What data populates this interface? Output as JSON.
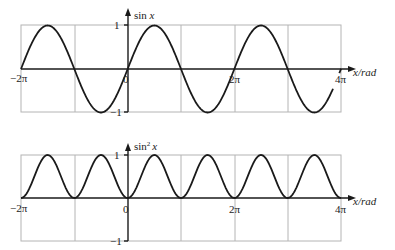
{
  "chart_data": [
    {
      "type": "line",
      "title": "",
      "ylabel": "sin x",
      "xlabel": "x/rad",
      "function": "sin(x)",
      "xlim": [
        "-2π",
        "4π"
      ],
      "ylim": [
        -1,
        1
      ],
      "x_ticks": [
        "−2π",
        "0",
        "2π",
        "4π"
      ],
      "y_ticks": [
        "1",
        "−1"
      ],
      "grid": true,
      "x": [
        -6.283,
        -4.712,
        -3.142,
        -1.571,
        0,
        1.571,
        3.142,
        4.712,
        6.283,
        7.854,
        9.425,
        10.996
      ],
      "values": [
        0,
        1,
        0,
        -1,
        0,
        1,
        0,
        -1,
        0,
        1,
        0,
        -1
      ],
      "note": "curve drawn from −2π up to about 3.85π"
    },
    {
      "type": "line",
      "title": "",
      "ylabel": "sin² x",
      "xlabel": "x/rad",
      "function": "sin^2(x)",
      "xlim": [
        "-2π",
        "4π"
      ],
      "ylim": [
        -1,
        1
      ],
      "x_ticks": [
        "−2π",
        "0",
        "2π",
        "4π"
      ],
      "y_ticks": [
        "1",
        "−1"
      ],
      "grid": true,
      "x": [
        -6.283,
        -4.712,
        -3.142,
        -1.571,
        0,
        1.571,
        3.142,
        4.712,
        6.283,
        7.854,
        9.425,
        10.996,
        12.566
      ],
      "values": [
        0,
        1,
        0,
        1,
        0,
        1,
        0,
        1,
        0,
        1,
        0,
        1,
        0
      ]
    }
  ],
  "top": {
    "ylabel_main": "sin ",
    "ylabel_var": "x",
    "tick_1": "1",
    "tick_m1": "−1",
    "x_m2pi": "−2π",
    "x_0": "0",
    "x_2pi": "2π",
    "x_4pi": "4π",
    "xlabel": "x/rad"
  },
  "bottom": {
    "ylabel_main": "sin",
    "ylabel_sup": "2",
    "ylabel_var": "x",
    "tick_1": "1",
    "tick_m1": "−1",
    "x_m2pi": "−2π",
    "x_0": "0",
    "x_2pi": "2π",
    "x_4pi": "4π",
    "xlabel": "x/rad"
  }
}
